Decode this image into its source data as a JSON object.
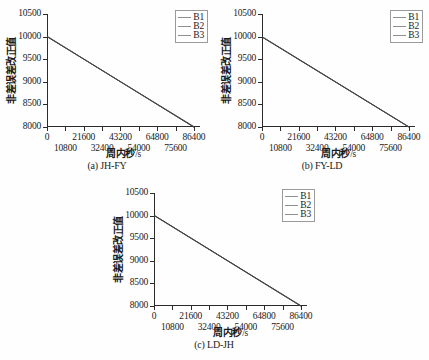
{
  "figure": {
    "panels": [
      {
        "id": "a",
        "caption": "(a) JH-FY",
        "chart_data": {
          "type": "line",
          "title": "",
          "xlabel": "周内秒",
          "xunit": "/s",
          "ylabel": "非差误差改正值",
          "xlim": [
            0,
            90000
          ],
          "ylim": [
            8000,
            10500
          ],
          "xticks": [
            0,
            10800,
            21600,
            32400,
            43200,
            54000,
            64800,
            75600,
            86400
          ],
          "xticklabels": [
            "0",
            "10800",
            "21600",
            "32400",
            "43200",
            "54000",
            "64800",
            "75600",
            "86400"
          ],
          "yticks": [
            8000,
            8500,
            9000,
            9500,
            10000,
            10500
          ],
          "yticklabels": [
            "8000",
            "8500",
            "9000",
            "9500",
            "10000",
            "10500"
          ],
          "grid": false,
          "legend_position": "top-right",
          "x": [
            0,
            86400
          ],
          "series": [
            {
              "name": "B1",
              "values": [
                10000,
                8000
              ],
              "color": "#303030"
            },
            {
              "name": "B2",
              "values": [
                10000,
                8010
              ],
              "color": "#3c3c3c"
            },
            {
              "name": "B3",
              "values": [
                10010,
                7995
              ],
              "color": "#484848"
            }
          ]
        }
      },
      {
        "id": "b",
        "caption": "(b) FY-LD",
        "chart_data": {
          "type": "line",
          "title": "",
          "xlabel": "周内秒",
          "xunit": "/s",
          "ylabel": "非差误差改正值",
          "xlim": [
            0,
            90000
          ],
          "ylim": [
            8000,
            10500
          ],
          "xticks": [
            0,
            10800,
            21600,
            32400,
            43200,
            54000,
            64800,
            75600,
            86400
          ],
          "xticklabels": [
            "0",
            "10800",
            "21600",
            "32400",
            "43200",
            "54000",
            "64800",
            "75600",
            "86400"
          ],
          "yticks": [
            8000,
            8500,
            9000,
            9500,
            10000,
            10500
          ],
          "yticklabels": [
            "8000",
            "8500",
            "9000",
            "9500",
            "10000",
            "10500"
          ],
          "grid": false,
          "legend_position": "top-right",
          "x": [
            0,
            86400
          ],
          "series": [
            {
              "name": "B1",
              "values": [
                9990,
                8000
              ],
              "color": "#303030"
            },
            {
              "name": "B2",
              "values": [
                10000,
                8005
              ],
              "color": "#3c3c3c"
            },
            {
              "name": "B3",
              "values": [
                9995,
                7998
              ],
              "color": "#484848"
            }
          ]
        }
      },
      {
        "id": "c",
        "caption": "(c) LD-JH",
        "chart_data": {
          "type": "line",
          "title": "",
          "xlabel": "周内秒",
          "xunit": "/s",
          "ylabel": "非差误差改正值",
          "xlim": [
            0,
            90000
          ],
          "ylim": [
            8000,
            10500
          ],
          "xticks": [
            0,
            10800,
            21600,
            32400,
            43200,
            54000,
            64800,
            75600,
            86400
          ],
          "xticklabels": [
            "0",
            "10800",
            "21600",
            "32400",
            "43200",
            "54000",
            "64800",
            "75600",
            "86400"
          ],
          "yticks": [
            8000,
            8500,
            9000,
            9500,
            10000,
            10500
          ],
          "yticklabels": [
            "8000",
            "8500",
            "9000",
            "9500",
            "10000",
            "10500"
          ],
          "grid": false,
          "legend_position": "top-right",
          "x": [
            0,
            86400
          ],
          "series": [
            {
              "name": "B1",
              "values": [
                10010,
                8000
              ],
              "color": "#303030"
            },
            {
              "name": "B2",
              "values": [
                10005,
                8008
              ],
              "color": "#3c3c3c"
            },
            {
              "name": "B3",
              "values": [
                10000,
                7996
              ],
              "color": "#484848"
            }
          ]
        }
      }
    ],
    "legend_labels": [
      "B1",
      "B2",
      "B3"
    ]
  }
}
